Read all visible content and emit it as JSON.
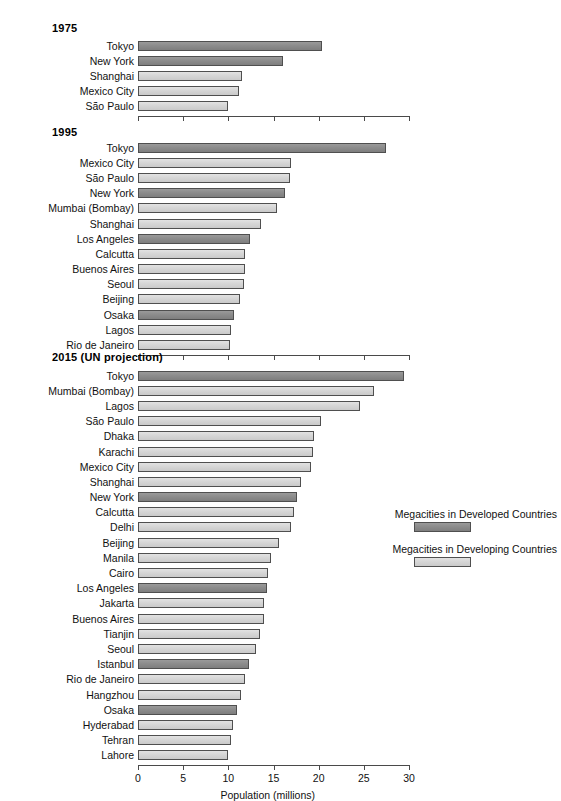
{
  "chart_data": {
    "type": "bar",
    "title": "",
    "xlabel": "Population (millions)",
    "ylabel": "",
    "xlim": [
      0,
      30
    ],
    "xticks": [
      0,
      5,
      10,
      15,
      20,
      25,
      30
    ],
    "xtick_labels": [
      "0",
      "5",
      "10",
      "15",
      "20",
      "25",
      "30"
    ],
    "grid": false,
    "orientation": "horizontal",
    "legend_position": "right-middle",
    "legend": [
      {
        "label": "Megacities in Developed Countries",
        "key": "developed",
        "color": "#8c8c8c"
      },
      {
        "label": "Megacities in Developing Countries",
        "key": "developing",
        "color": "#d6d6d6"
      }
    ],
    "panels": [
      {
        "title": "1975",
        "categories": [
          "Tokyo",
          "New York",
          "Shanghai",
          "Mexico City",
          "São Paulo"
        ],
        "values": [
          20.4,
          16.0,
          11.5,
          11.2,
          10.0
        ],
        "groups": [
          "developed",
          "developed",
          "developing",
          "developing",
          "developing"
        ]
      },
      {
        "title": "1995",
        "categories": [
          "Tokyo",
          "Mexico City",
          "São Paulo",
          "New York",
          "Mumbai (Bombay)",
          "Shanghai",
          "Los Angeles",
          "Calcutta",
          "Buenos Aires",
          "Seoul",
          "Beijing",
          "Osaka",
          "Lagos",
          "Rio de Janeiro"
        ],
        "values": [
          27.4,
          16.9,
          16.8,
          16.3,
          15.4,
          13.6,
          12.4,
          11.9,
          11.9,
          11.7,
          11.3,
          10.6,
          10.3,
          10.2
        ],
        "groups": [
          "developed",
          "developing",
          "developing",
          "developed",
          "developing",
          "developing",
          "developed",
          "developing",
          "developing",
          "developing",
          "developing",
          "developed",
          "developing",
          "developing"
        ]
      },
      {
        "title": "2015 (UN projection)",
        "categories": [
          "Tokyo",
          "Mumbai (Bombay)",
          "Lagos",
          "São Paulo",
          "Dhaka",
          "Karachi",
          "Mexico City",
          "Shanghai",
          "New York",
          "Calcutta",
          "Delhi",
          "Beijing",
          "Manila",
          "Cairo",
          "Los Angeles",
          "Jakarta",
          "Buenos Aires",
          "Tianjin",
          "Seoul",
          "Istanbul",
          "Rio de Janeiro",
          "Hangzhou",
          "Osaka",
          "Hyderabad",
          "Tehran",
          "Lahore"
        ],
        "values": [
          29.4,
          26.1,
          24.6,
          20.3,
          19.5,
          19.4,
          19.2,
          18.0,
          17.6,
          17.3,
          16.9,
          15.6,
          14.7,
          14.4,
          14.3,
          13.9,
          13.9,
          13.5,
          13.1,
          12.3,
          11.9,
          11.4,
          11.0,
          10.5,
          10.3,
          10.0
        ],
        "groups": [
          "developed",
          "developing",
          "developing",
          "developing",
          "developing",
          "developing",
          "developing",
          "developing",
          "developed",
          "developing",
          "developing",
          "developing",
          "developing",
          "developing",
          "developed",
          "developing",
          "developing",
          "developing",
          "developing",
          "developed",
          "developing",
          "developing",
          "developed",
          "developing",
          "developing",
          "developing"
        ]
      }
    ]
  }
}
